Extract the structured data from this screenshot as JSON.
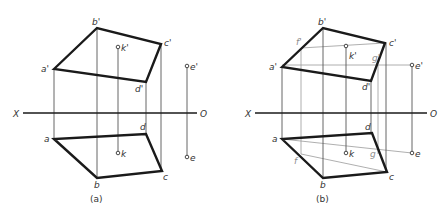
{
  "figure": {
    "panels": [
      {
        "caption": "(a)",
        "axis": {
          "left_label": "X",
          "right_label": "O"
        },
        "labels": {
          "a_prime": "a'",
          "b_prime": "b'",
          "c_prime": "c'",
          "d_prime": "d'",
          "k_prime": "k'",
          "e_prime": "e'",
          "a": "a",
          "b": "b",
          "c": "c",
          "d": "d",
          "k": "k",
          "e": "e"
        }
      },
      {
        "caption": "(b)",
        "axis": {
          "left_label": "X",
          "right_label": "O"
        },
        "labels": {
          "a_prime": "a'",
          "b_prime": "b'",
          "c_prime": "c'",
          "d_prime": "d'",
          "k_prime": "k'",
          "e_prime": "e'",
          "f_prime": "f'",
          "g_prime": "g'",
          "a": "a",
          "b": "b",
          "c": "c",
          "d": "d",
          "k": "k",
          "e": "e",
          "f": "f",
          "g": "g"
        }
      }
    ]
  }
}
